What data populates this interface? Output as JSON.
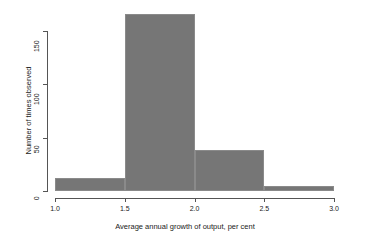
{
  "chart_data": {
    "type": "bar",
    "title": "",
    "subtitle": "",
    "xlabel": "Average annual growth of output, per cent",
    "ylabel": "Number of times observed",
    "xlim": [
      1.0,
      3.0
    ],
    "ylim": [
      0,
      175
    ],
    "xticks": [
      "1.0",
      "1.5",
      "2.0",
      "2.5",
      "3.0"
    ],
    "xtick_values": [
      1.0,
      1.5,
      2.0,
      2.5,
      3.0
    ],
    "yticks": [
      "0",
      "50",
      "100",
      "150"
    ],
    "ytick_values": [
      0,
      50,
      100,
      150
    ],
    "grid": false,
    "legend": null,
    "bin_width": 0.5,
    "categories": [
      "1.0-1.5",
      "1.5-2.0",
      "2.0-2.5",
      "2.5-3.0"
    ],
    "bin_edges": [
      1.0,
      1.5,
      2.0,
      2.5,
      3.0
    ],
    "values": [
      12,
      166,
      38,
      5
    ],
    "bars": [
      {
        "label": "1.0-1.5",
        "x0": 1.0,
        "x1": 1.5,
        "value": 12
      },
      {
        "label": "1.5-2.0",
        "x0": 1.5,
        "x1": 2.0,
        "value": 166
      },
      {
        "label": "2.0-2.5",
        "x0": 2.0,
        "x1": 2.5,
        "value": 38
      },
      {
        "label": "2.5-3.0",
        "x0": 2.5,
        "x1": 3.0,
        "value": 5
      }
    ],
    "colors": {
      "bar_fill": "#767676",
      "bar_border": "#8a8a8a",
      "axis": "#555555",
      "text": "#1a1a1a",
      "background": "#ffffff"
    }
  }
}
